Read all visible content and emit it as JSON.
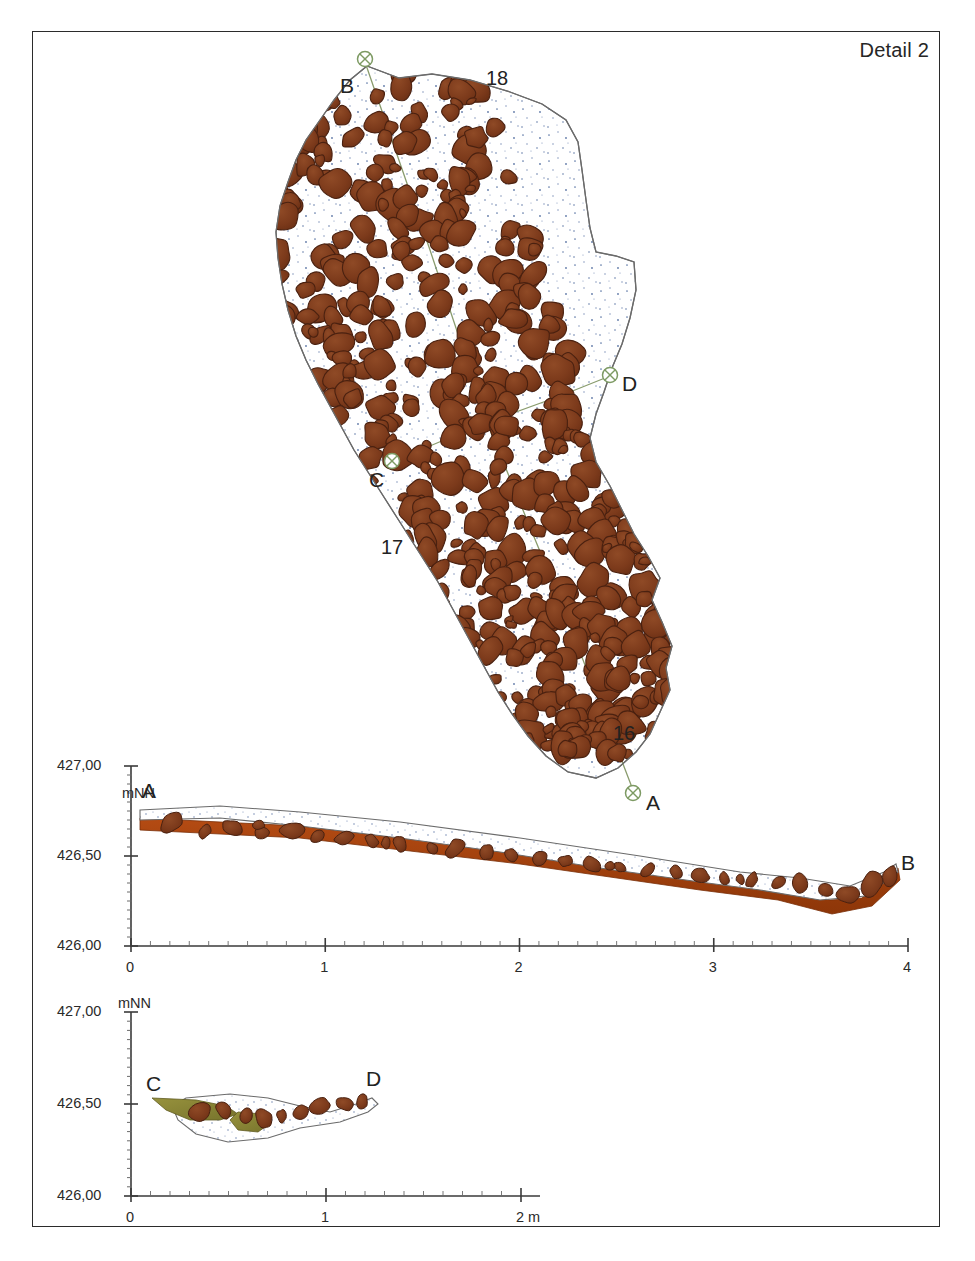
{
  "sheet": {
    "title": "Detail 2",
    "border_color": "#2b2b2b",
    "background": "#ffffff"
  },
  "palette": {
    "stone_fill": "#7c3a1b",
    "stone_fill_light": "#8c4723",
    "stone_stroke": "#4a2110",
    "basal_layer": "#a8410f",
    "olive_layer": "#8a8637",
    "matrix_fill": "#ffffff",
    "matrix_stroke": "#6b6b6b",
    "speckle": "#5f79a8",
    "marker_green": "#7d9a63",
    "section_line": "#8a9c6e",
    "axis": "#3a3a3a",
    "text": "#222222"
  },
  "plan": {
    "name": "stone-pavement-plan",
    "context_labels": [
      {
        "text": "18",
        "x": 486,
        "y": 68
      },
      {
        "text": "17",
        "x": 381,
        "y": 537
      },
      {
        "text": "16",
        "x": 613,
        "y": 723
      }
    ],
    "survey_points": [
      {
        "id": "B",
        "label": "B",
        "marker_x": 365,
        "marker_y": 59,
        "label_x": 340,
        "label_y": 75
      },
      {
        "id": "D",
        "label": "D",
        "marker_x": 610,
        "marker_y": 375,
        "label_x": 622,
        "label_y": 373
      },
      {
        "id": "C",
        "label": "C",
        "marker_x": 392,
        "marker_y": 461,
        "label_x": 369,
        "label_y": 469
      },
      {
        "id": "A",
        "label": "A",
        "marker_x": 633,
        "marker_y": 793,
        "label_x": 646,
        "label_y": 792
      }
    ],
    "section_lines": [
      {
        "name": "section-line-b-a",
        "from": "B",
        "to": "A"
      },
      {
        "name": "section-line-c-d",
        "from": "C",
        "to": "D"
      }
    ]
  },
  "profiles": [
    {
      "name": "profile-a-b",
      "from_label": "A",
      "to_label": "B",
      "unit_label": "mNN",
      "y_ticks": [
        "427,00",
        "426,50",
        "426,00"
      ],
      "y_values": [
        427.0,
        426.5,
        426.0
      ],
      "x_ticks": [
        "0",
        "1",
        "2",
        "3",
        "4"
      ],
      "x_values": [
        0,
        1,
        2,
        3,
        4
      ],
      "x_unit": "",
      "from_label_x": 148,
      "from_label_y": 780,
      "to_label_x": 901,
      "to_label_y": 852
    },
    {
      "name": "profile-c-d",
      "from_label": "C",
      "to_label": "D",
      "unit_label": "mNN",
      "y_ticks": [
        "427,00",
        "426,50",
        "426,00"
      ],
      "y_values": [
        427.0,
        426.5,
        426.0
      ],
      "x_ticks": [
        "0",
        "1",
        "2 m"
      ],
      "x_values": [
        0,
        1,
        2
      ],
      "x_unit": "m",
      "from_label_x": 146,
      "from_label_y": 1085,
      "to_label_x": 366,
      "to_label_y": 1080
    }
  ],
  "chart_data": {
    "type": "line",
    "title": "Detail 2",
    "subcharts": [
      {
        "name": "profile-a-b",
        "xlabel": "",
        "ylabel": "mNN",
        "xlim": [
          0,
          4
        ],
        "ylim": [
          426.0,
          427.0
        ],
        "surface_profile_x": [
          0.0,
          0.3,
          0.7,
          1.1,
          1.5,
          1.9,
          2.3,
          2.7,
          3.1,
          3.5,
          3.75,
          4.0
        ],
        "surface_profile_y": [
          426.73,
          426.68,
          426.63,
          426.6,
          426.57,
          426.54,
          426.52,
          426.49,
          426.47,
          426.43,
          426.38,
          426.44
        ]
      },
      {
        "name": "profile-c-d",
        "xlabel": "m",
        "ylabel": "mNN",
        "xlim": [
          0,
          2
        ],
        "ylim": [
          426.0,
          427.0
        ],
        "surface_profile_x": [
          0.1,
          0.3,
          0.5,
          0.7,
          0.9,
          1.1,
          1.25
        ],
        "surface_profile_y": [
          426.58,
          426.53,
          426.45,
          426.42,
          426.5,
          426.55,
          426.56
        ]
      }
    ]
  }
}
